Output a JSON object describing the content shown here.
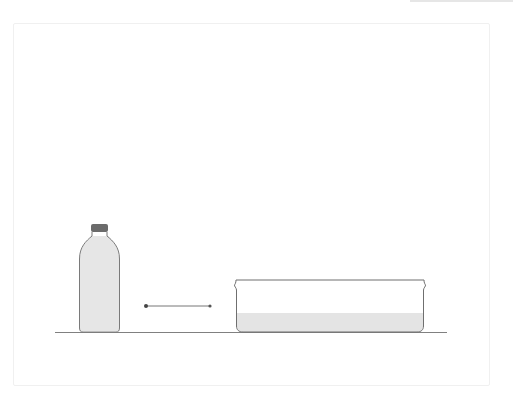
{
  "diagram": {
    "elements": [
      {
        "name": "bottle",
        "contents": "water",
        "fill_level": "full"
      },
      {
        "name": "arrow",
        "direction": "right"
      },
      {
        "name": "pan",
        "contents": "water",
        "fill_level": "shallow"
      }
    ]
  },
  "colors": {
    "outline": "#7a7a7a",
    "cap": "#6b6b6b",
    "water": "#e4e4e4",
    "ground": "#808080",
    "arrow": "#555555",
    "frame": "#f0f0f0"
  }
}
